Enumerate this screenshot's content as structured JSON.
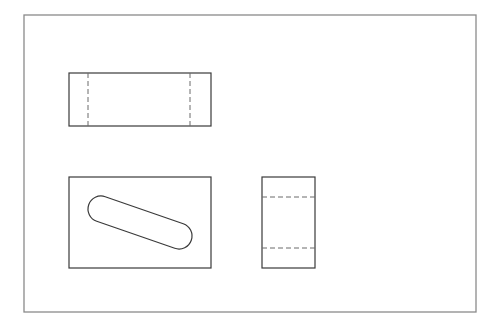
{
  "drawing": {
    "title": "Orthographic projection of a block with an inclined slot",
    "colors": {
      "background": "#ffffff",
      "frame": "#8a8a8a",
      "outline": "#3a3a3a",
      "hidden": "#6a6a6a"
    },
    "frame": {
      "x": 24,
      "y": 15,
      "w": 452,
      "h": 297
    },
    "views": {
      "front": {
        "label": "front-view",
        "rect": {
          "x": 69,
          "y": 73,
          "w": 142,
          "h": 53
        },
        "hidden_lines": [
          {
            "x1": 88,
            "y1": 73,
            "x2": 88,
            "y2": 126
          },
          {
            "x1": 190,
            "y1": 73,
            "x2": 190,
            "y2": 126
          }
        ]
      },
      "top": {
        "label": "top-view",
        "rect": {
          "x": 69,
          "y": 177,
          "w": 142,
          "h": 91
        },
        "slot": {
          "cx1": 101,
          "cy1": 209,
          "cx2": 179,
          "cy2": 236,
          "r": 13
        }
      },
      "side": {
        "label": "side-view",
        "rect": {
          "x": 262,
          "y": 177,
          "w": 53,
          "h": 91
        },
        "hidden_lines": [
          {
            "x1": 262,
            "y1": 197,
            "x2": 315,
            "y2": 197
          },
          {
            "x1": 262,
            "y1": 248,
            "x2": 315,
            "y2": 248
          }
        ]
      }
    }
  }
}
